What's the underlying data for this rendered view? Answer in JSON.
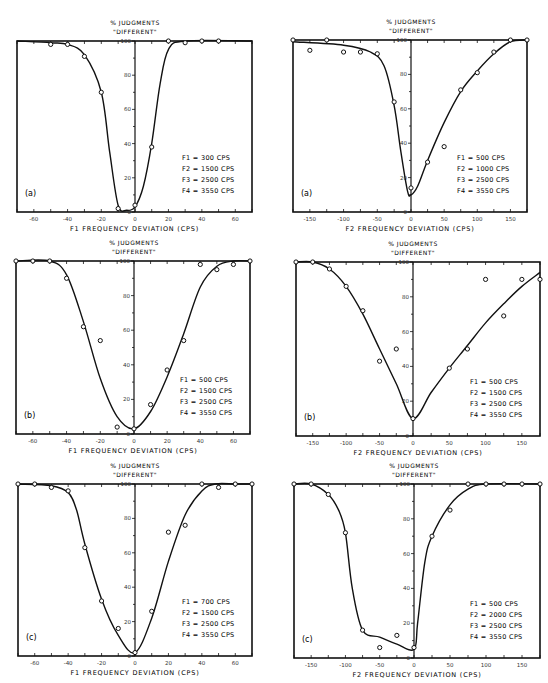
{
  "chart_data": [
    {
      "type": "line",
      "panel": "(a)",
      "title": "% JUDGMENTS \"DIFFERENT\"",
      "xlabel": "F1 FREQUENCY DEVIATION (CPS)",
      "ylabel": "% JUDGMENTS \"DIFFERENT\"",
      "xlim": [
        -70,
        70
      ],
      "ylim": [
        0,
        100
      ],
      "xticks": [
        -60,
        -40,
        -20,
        0,
        20,
        40,
        60
      ],
      "yticks": [
        0,
        20,
        40,
        60,
        80,
        100
      ],
      "legend": [
        "F1 = 300 CPS",
        "F2 = 1500 CPS",
        "F3 = 2500 CPS",
        "F4 = 3550 CPS"
      ],
      "series": [
        {
          "name": "observed",
          "x": [
            -50,
            -40,
            -30,
            -20,
            -10,
            0,
            10,
            20,
            30,
            40,
            50
          ],
          "values": [
            98,
            98,
            91,
            70,
            2,
            4,
            38,
            100,
            99,
            100,
            100
          ]
        },
        {
          "name": "fitted",
          "x": [
            -70,
            -50,
            -40,
            -30,
            -20,
            -15,
            -10,
            -5,
            0,
            5,
            10,
            15,
            20,
            30,
            70
          ],
          "values": [
            100,
            99,
            98,
            92,
            70,
            35,
            4,
            1,
            3,
            15,
            40,
            75,
            95,
            100,
            100
          ]
        }
      ]
    },
    {
      "type": "line",
      "panel": "(a)",
      "title": "% JUDGMENTS \"DIFFERENT\"",
      "xlabel": "F2 FREQUENCY DEVIATION (CPS)",
      "ylabel": "% JUDGMENTS \"DIFFERENT\"",
      "xlim": [
        -175,
        175
      ],
      "ylim": [
        0,
        100
      ],
      "xticks": [
        -150,
        -100,
        -50,
        0,
        50,
        100,
        150
      ],
      "yticks": [
        0,
        20,
        40,
        60,
        80,
        100
      ],
      "legend": [
        "F1 = 500 CPS",
        "F2 = 1000 CPS",
        "F3 = 2500 CPS",
        "F4 = 3550 CPS"
      ],
      "series": [
        {
          "name": "observed",
          "x": [
            -175,
            -150,
            -125,
            -100,
            -75,
            -50,
            -25,
            0,
            25,
            50,
            75,
            100,
            125,
            150,
            175
          ],
          "values": [
            100,
            94,
            100,
            93,
            93,
            92,
            64,
            14,
            29,
            38,
            71,
            81,
            93,
            100,
            100
          ]
        },
        {
          "name": "fitted",
          "x": [
            -175,
            -100,
            -60,
            -40,
            -25,
            -15,
            -5,
            0,
            10,
            25,
            50,
            75,
            100,
            125,
            150,
            175
          ],
          "values": [
            99,
            97,
            93,
            85,
            62,
            35,
            12,
            10,
            15,
            30,
            52,
            70,
            82,
            92,
            99,
            100
          ]
        }
      ]
    },
    {
      "type": "line",
      "panel": "(b)",
      "title": "% JUDGMENTS \"DIFFERENT\"",
      "xlabel": "F1 FREQUENCY DEVIATION (CPS)",
      "ylabel": "% JUDGMENTS \"DIFFERENT\"",
      "xlim": [
        -70,
        70
      ],
      "ylim": [
        0,
        100
      ],
      "xticks": [
        -60,
        -40,
        -20,
        0,
        20,
        40,
        60
      ],
      "yticks": [
        0,
        20,
        40,
        60,
        80,
        100
      ],
      "legend": [
        "F1 = 500 CPS",
        "F2 = 1500 CPS",
        "F3 = 2500 CPS",
        "F4 = 3550 CPS"
      ],
      "series": [
        {
          "name": "observed",
          "x": [
            -70,
            -60,
            -50,
            -40,
            -30,
            -20,
            -10,
            0,
            10,
            20,
            30,
            40,
            50,
            60,
            70
          ],
          "values": [
            100,
            100,
            100,
            90,
            62,
            54,
            4,
            3,
            17,
            37,
            54,
            98,
            95,
            98,
            100
          ]
        },
        {
          "name": "fitted",
          "x": [
            -70,
            -50,
            -40,
            -30,
            -20,
            -10,
            0,
            10,
            20,
            30,
            40,
            50,
            60,
            70
          ],
          "values": [
            100,
            100,
            92,
            65,
            32,
            10,
            3,
            13,
            33,
            58,
            85,
            97,
            100,
            100
          ]
        }
      ]
    },
    {
      "type": "line",
      "panel": "(b)",
      "title": "% JUDGMENTS \"DIFFERENT\"",
      "xlabel": "F2 FREQUENCY DEVIATION (CPS)",
      "ylabel": "% JUDGMENTS \"DIFFERENT\"",
      "xlim": [
        -175,
        175
      ],
      "ylim": [
        0,
        100
      ],
      "xticks": [
        -150,
        -100,
        -50,
        0,
        50,
        100,
        150
      ],
      "yticks": [
        0,
        20,
        40,
        60,
        80,
        100
      ],
      "legend": [
        "F1 = 500 CPS",
        "F2 = 1500 CPS",
        "F3 = 2500 CPS",
        "F4 = 3550 CPS"
      ],
      "series": [
        {
          "name": "observed",
          "x": [
            -175,
            -150,
            -125,
            -100,
            -75,
            -50,
            -25,
            0,
            50,
            75,
            100,
            125,
            150,
            175
          ],
          "values": [
            100,
            100,
            96,
            86,
            72,
            43,
            50,
            10,
            39,
            50,
            90,
            69,
            90,
            90
          ]
        },
        {
          "name": "fitted",
          "x": [
            -175,
            -150,
            -125,
            -100,
            -75,
            -50,
            -25,
            0,
            25,
            50,
            75,
            100,
            125,
            150,
            175
          ],
          "values": [
            100,
            100,
            96,
            86,
            70,
            50,
            30,
            10,
            25,
            39,
            52,
            65,
            76,
            86,
            94
          ]
        }
      ]
    },
    {
      "type": "line",
      "panel": "(c)",
      "title": "% JUDGMENTS \"DIFFERENT\"",
      "xlabel": "F1 FREQUENCY DEVIATION (CPS)",
      "ylabel": "% JUDGMENTS \"DIFFERENT\"",
      "xlim": [
        -70,
        70
      ],
      "ylim": [
        0,
        100
      ],
      "xticks": [
        -60,
        -40,
        -20,
        0,
        20,
        40,
        60
      ],
      "yticks": [
        0,
        20,
        40,
        60,
        80,
        100
      ],
      "legend": [
        "F1 = 700 CPS",
        "F2 = 1500 CPS",
        "F3 = 2500 CPS",
        "F4 = 3550 CPS"
      ],
      "series": [
        {
          "name": "observed",
          "x": [
            -70,
            -60,
            -50,
            -40,
            -30,
            -20,
            -10,
            0,
            10,
            20,
            30,
            40,
            50,
            60,
            70
          ],
          "values": [
            100,
            100,
            98,
            96,
            63,
            32,
            16,
            2,
            26,
            72,
            76,
            100,
            98,
            100,
            100
          ]
        },
        {
          "name": "fitted",
          "x": [
            -70,
            -50,
            -40,
            -35,
            -30,
            -20,
            -10,
            0,
            10,
            20,
            30,
            40,
            48,
            60,
            70
          ],
          "values": [
            100,
            99,
            95,
            85,
            65,
            33,
            12,
            2,
            22,
            55,
            82,
            96,
            100,
            100,
            100
          ]
        }
      ]
    },
    {
      "type": "line",
      "panel": "(c)",
      "title": "% JUDGMENTS \"DIFFERENT\"",
      "xlabel": "F2 FREQUENCY DEVIATION (CPS)",
      "ylabel": "% JUDGMENTS \"DIFFERENT\"",
      "xlim": [
        -175,
        175
      ],
      "ylim": [
        0,
        100
      ],
      "xticks": [
        -150,
        -100,
        -50,
        0,
        50,
        100,
        150
      ],
      "yticks": [
        0,
        20,
        40,
        60,
        80,
        100
      ],
      "legend": [
        "F1 = 500 CPS",
        "F2 = 2000 CPS",
        "F3 = 2500 CPS",
        "F4 = 3550 CPS"
      ],
      "series": [
        {
          "name": "observed",
          "x": [
            -175,
            -150,
            -125,
            -100,
            -75,
            -50,
            -25,
            0,
            25,
            50,
            75,
            100,
            125,
            150,
            175
          ],
          "values": [
            100,
            100,
            94,
            72,
            16,
            6,
            13,
            6,
            70,
            85,
            100,
            100,
            100,
            100,
            100
          ]
        },
        {
          "name": "fitted",
          "x": [
            -175,
            -150,
            -125,
            -110,
            -100,
            -90,
            -75,
            -50,
            -25,
            0,
            5,
            15,
            25,
            50,
            75,
            100,
            175
          ],
          "values": [
            100,
            100,
            94,
            85,
            72,
            40,
            16,
            12,
            8,
            5,
            20,
            55,
            70,
            88,
            97,
            100,
            100
          ]
        }
      ]
    }
  ],
  "labels": {
    "ylabel_line1": "% JUDGMENTS",
    "ylabel_line2": "\"DIFFERENT\"",
    "xlabel_f1": "F1 FREQUENCY DEVIATION (CPS)",
    "xlabel_f2": "F2 FREQUENCY DEVIATION (CPS)"
  }
}
